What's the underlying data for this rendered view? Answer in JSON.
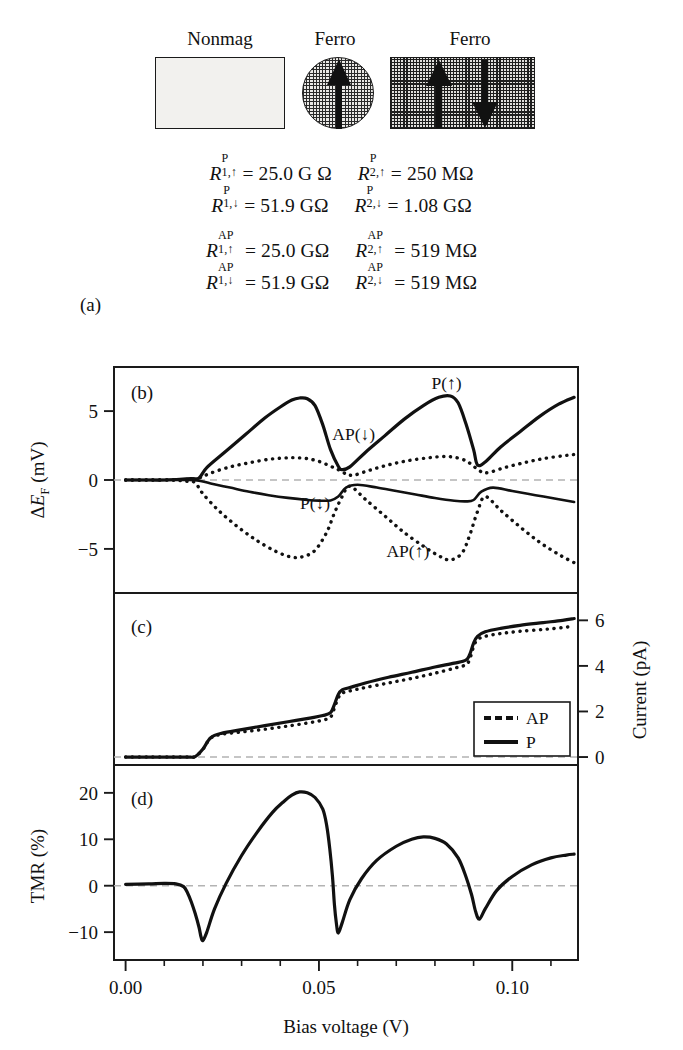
{
  "schematic": {
    "nonmag_label": "Nonmag",
    "ferro1_label": "Ferro",
    "ferro2_label": "Ferro",
    "arrows": [
      "up",
      "up",
      "down"
    ]
  },
  "panel_a": {
    "label": "(a)",
    "equations": [
      [
        {
          "symbol": "R",
          "sup": "P",
          "sub": "1,↑",
          "eq": "=",
          "value": "25.0 G Ω"
        },
        {
          "symbol": "R",
          "sup": "P",
          "sub": "2,↑",
          "eq": "=",
          "value": "250 MΩ"
        }
      ],
      [
        {
          "symbol": "R",
          "sup": "P",
          "sub": "1,↓",
          "eq": "=",
          "value": "51.9 GΩ"
        },
        {
          "symbol": "R",
          "sup": "P",
          "sub": "2,↓",
          "eq": "=",
          "value": "1.08 GΩ"
        }
      ],
      [
        {
          "symbol": "R",
          "sup": "AP",
          "sub": "1,↑",
          "eq": "=",
          "value": "25.0 GΩ"
        },
        {
          "symbol": "R",
          "sup": "AP",
          "sub": "2,↑",
          "eq": "=",
          "value": "519 MΩ"
        }
      ],
      [
        {
          "symbol": "R",
          "sup": "AP",
          "sub": "1,↓",
          "eq": "=",
          "value": "51.9 GΩ"
        },
        {
          "symbol": "R",
          "sup": "AP",
          "sub": "2,↓",
          "eq": "=",
          "value": "519 MΩ"
        }
      ]
    ]
  },
  "axes": {
    "xlabel": "Bias voltage (V)",
    "xticks": [
      "0.00",
      "0.05",
      "0.10"
    ],
    "xtick_values": [
      0.0,
      0.05,
      0.1
    ],
    "xlim": [
      -0.003,
      0.117
    ]
  },
  "panel_b": {
    "label": "(b)",
    "ylabel_parts": {
      "delta": "Δ",
      "e": "E",
      "sub": "F",
      "unit": " (mV)"
    },
    "ylabel": "ΔE_F (mV)",
    "yticks": [
      "5",
      "0",
      "−5"
    ],
    "ytick_values": [
      5,
      0,
      -5
    ],
    "ylim": [
      -8.2,
      8.2
    ],
    "annotations": [
      {
        "text": "P(↑)",
        "x": 0.083,
        "y": 6.6
      },
      {
        "text": "AP(↓)",
        "x": 0.059,
        "y": 2.9
      },
      {
        "text": "P(↓)",
        "x": 0.049,
        "y": -2.1
      },
      {
        "text": "AP(↑)",
        "x": 0.073,
        "y": -5.6
      }
    ]
  },
  "panel_c": {
    "label": "(c)",
    "ylabel": "Current (pA)",
    "yticks": [
      "6",
      "4",
      "2",
      "0"
    ],
    "ytick_values": [
      6,
      4,
      2,
      0
    ],
    "ylim": [
      -0.35,
      7.2
    ],
    "legend": {
      "items": [
        "AP",
        "P"
      ],
      "styles": [
        "dashed",
        "solid"
      ]
    }
  },
  "panel_d": {
    "label": "(d)",
    "ylabel": "TMR (%)",
    "yticks": [
      "20",
      "10",
      "0",
      "−10"
    ],
    "ytick_values": [
      20,
      10,
      0,
      -10
    ],
    "ylim": [
      -16,
      26
    ]
  },
  "chart_data": {
    "type": "line",
    "title": "",
    "xlabel": "Bias voltage (V)",
    "panels": [
      {
        "id": "b",
        "ylabel": "ΔE_F (mV)",
        "ylim": [
          -8.2,
          8.2
        ],
        "series": [
          {
            "name": "P(↑)",
            "style": "solid",
            "x": [
              0.0,
              0.005,
              0.01,
              0.014,
              0.017,
              0.019,
              0.021,
              0.026,
              0.031,
              0.036,
              0.04,
              0.043,
              0.045,
              0.047,
              0.049,
              0.051,
              0.053,
              0.055,
              0.056,
              0.058,
              0.062,
              0.067,
              0.072,
              0.077,
              0.081,
              0.084,
              0.086,
              0.088,
              0.09,
              0.091,
              0.093,
              0.097,
              0.102,
              0.107,
              0.112,
              0.116
            ],
            "y": [
              0.0,
              0.0,
              0.0,
              0.05,
              0.1,
              0.15,
              0.9,
              2.1,
              3.3,
              4.5,
              5.3,
              5.8,
              5.95,
              5.9,
              5.4,
              4.0,
              2.2,
              1.0,
              0.75,
              0.95,
              2.0,
              3.2,
              4.4,
              5.4,
              6.0,
              6.1,
              5.6,
              4.1,
              2.2,
              1.1,
              1.3,
              2.4,
              3.5,
              4.6,
              5.5,
              6.0
            ]
          },
          {
            "name": "P(↓)",
            "style": "solid",
            "x": [
              0.0,
              0.006,
              0.012,
              0.016,
              0.019,
              0.022,
              0.027,
              0.032,
              0.037,
              0.042,
              0.047,
              0.05,
              0.053,
              0.055,
              0.057,
              0.06,
              0.065,
              0.07,
              0.075,
              0.08,
              0.085,
              0.088,
              0.09,
              0.092,
              0.095,
              0.1,
              0.106,
              0.112,
              0.116
            ],
            "y": [
              0.0,
              0.0,
              0.0,
              0.0,
              -0.05,
              -0.25,
              -0.55,
              -0.85,
              -1.1,
              -1.3,
              -1.45,
              -1.5,
              -1.48,
              -1.2,
              -0.55,
              -0.35,
              -0.55,
              -0.8,
              -1.05,
              -1.3,
              -1.5,
              -1.55,
              -1.45,
              -0.85,
              -0.55,
              -0.8,
              -1.1,
              -1.4,
              -1.6
            ]
          },
          {
            "name": "AP(↓)",
            "style": "dotted",
            "x": [
              0.0,
              0.006,
              0.012,
              0.016,
              0.019,
              0.022,
              0.027,
              0.032,
              0.037,
              0.041,
              0.044,
              0.047,
              0.05,
              0.053,
              0.055,
              0.057,
              0.059,
              0.063,
              0.068,
              0.073,
              0.078,
              0.082,
              0.085,
              0.088,
              0.09,
              0.092,
              0.094,
              0.098,
              0.103,
              0.108,
              0.113,
              0.116
            ],
            "y": [
              0.0,
              0.0,
              0.0,
              0.05,
              0.15,
              0.5,
              0.95,
              1.25,
              1.5,
              1.6,
              1.62,
              1.55,
              1.35,
              1.0,
              0.75,
              0.45,
              0.35,
              0.7,
              1.1,
              1.4,
              1.6,
              1.7,
              1.65,
              1.4,
              1.0,
              0.6,
              0.55,
              0.9,
              1.25,
              1.55,
              1.75,
              1.85
            ]
          },
          {
            "name": "AP(↑)",
            "style": "dotted",
            "x": [
              0.0,
              0.006,
              0.012,
              0.016,
              0.018,
              0.02,
              0.024,
              0.029,
              0.034,
              0.039,
              0.043,
              0.046,
              0.049,
              0.052,
              0.054,
              0.056,
              0.058,
              0.062,
              0.067,
              0.072,
              0.077,
              0.081,
              0.084,
              0.087,
              0.089,
              0.091,
              0.093,
              0.097,
              0.102,
              0.107,
              0.112,
              0.116
            ],
            "y": [
              0.0,
              0.0,
              0.0,
              -0.1,
              -0.2,
              -1.0,
              -2.2,
              -3.4,
              -4.4,
              -5.2,
              -5.6,
              -5.55,
              -5.1,
              -3.8,
              -2.4,
              -1.2,
              -0.45,
              -1.4,
              -2.6,
              -3.8,
              -4.8,
              -5.5,
              -5.8,
              -5.3,
              -4.0,
              -2.3,
              -1.2,
              -2.2,
              -3.4,
              -4.5,
              -5.4,
              -6.0
            ]
          }
        ]
      },
      {
        "id": "c",
        "ylabel": "Current (pA)",
        "ylim": [
          -0.35,
          7.2
        ],
        "series": [
          {
            "name": "P",
            "style": "solid",
            "x": [
              0.0,
              0.006,
              0.012,
              0.016,
              0.018,
              0.02,
              0.022,
              0.025,
              0.03,
              0.036,
              0.042,
              0.048,
              0.051,
              0.053,
              0.054,
              0.055,
              0.056,
              0.058,
              0.062,
              0.068,
              0.074,
              0.08,
              0.085,
              0.088,
              0.089,
              0.09,
              0.091,
              0.093,
              0.097,
              0.102,
              0.108,
              0.113,
              0.116
            ],
            "y": [
              0.0,
              0.0,
              0.0,
              0.0,
              0.02,
              0.35,
              0.85,
              1.05,
              1.2,
              1.38,
              1.55,
              1.72,
              1.82,
              1.95,
              2.3,
              2.75,
              2.95,
              3.05,
              3.25,
              3.5,
              3.72,
              3.95,
              4.12,
              4.25,
              4.5,
              5.0,
              5.3,
              5.5,
              5.65,
              5.78,
              5.9,
              6.0,
              6.08
            ]
          },
          {
            "name": "AP",
            "style": "dotted",
            "x": [
              0.0,
              0.006,
              0.012,
              0.016,
              0.018,
              0.02,
              0.022,
              0.025,
              0.03,
              0.036,
              0.042,
              0.048,
              0.051,
              0.053,
              0.054,
              0.055,
              0.056,
              0.058,
              0.062,
              0.068,
              0.074,
              0.08,
              0.085,
              0.088,
              0.089,
              0.09,
              0.091,
              0.093,
              0.097,
              0.102,
              0.108,
              0.113,
              0.116
            ],
            "y": [
              0.0,
              0.0,
              0.0,
              0.0,
              0.02,
              0.34,
              0.83,
              1.0,
              1.1,
              1.22,
              1.36,
              1.52,
              1.62,
              1.75,
              2.15,
              2.6,
              2.8,
              2.9,
              3.05,
              3.25,
              3.45,
              3.68,
              3.9,
              4.05,
              4.3,
              4.85,
              5.15,
              5.3,
              5.42,
              5.52,
              5.6,
              5.68,
              5.75
            ]
          }
        ]
      },
      {
        "id": "d",
        "ylabel": "TMR (%)",
        "ylim": [
          -16,
          26
        ],
        "series": [
          {
            "name": "TMR",
            "style": "solid",
            "x": [
              0.0,
              0.006,
              0.01,
              0.013,
              0.015,
              0.016,
              0.017,
              0.018,
              0.019,
              0.0195,
              0.02,
              0.021,
              0.023,
              0.026,
              0.03,
              0.034,
              0.038,
              0.041,
              0.043,
              0.045,
              0.047,
              0.049,
              0.051,
              0.052,
              0.0528,
              0.0535,
              0.054,
              0.0545,
              0.055,
              0.056,
              0.058,
              0.061,
              0.065,
              0.07,
              0.074,
              0.077,
              0.08,
              0.083,
              0.086,
              0.088,
              0.0895,
              0.0905,
              0.0915,
              0.093,
              0.096,
              0.1,
              0.105,
              0.11,
              0.114,
              0.116
            ],
            "y": [
              0.3,
              0.4,
              0.5,
              0.4,
              -0.2,
              -1.5,
              -3.5,
              -6.0,
              -9.0,
              -11.0,
              -11.8,
              -10.0,
              -5.0,
              0.5,
              6.5,
              11.5,
              15.8,
              18.2,
              19.5,
              20.2,
              20.0,
              19.0,
              16.5,
              13.0,
              8.0,
              2.0,
              -4.0,
              -8.0,
              -10.2,
              -8.0,
              -3.0,
              1.5,
              5.5,
              8.5,
              10.0,
              10.5,
              10.2,
              9.0,
              6.0,
              2.0,
              -2.0,
              -5.5,
              -7.2,
              -5.0,
              -1.0,
              2.0,
              4.5,
              6.0,
              6.6,
              6.8
            ]
          }
        ]
      }
    ]
  }
}
